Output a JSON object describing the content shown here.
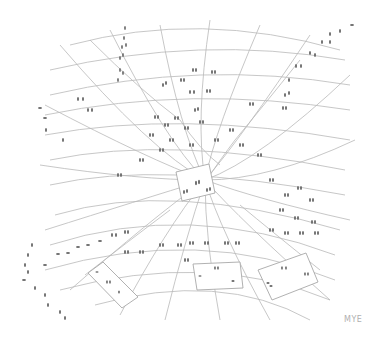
{
  "artwork": {
    "description": "Pencil drawing of a warped grid spiralling into a central tilted square, with footprint tracks and several tilted blank panels",
    "signature": "MYE",
    "colors": {
      "background": "#ffffff",
      "grid_line": "#b9b9b9",
      "footprint": "#6a6a6a",
      "signature": "#b0b0b0"
    },
    "center_square": {
      "label": "central-panel"
    },
    "panels": [
      {
        "name": "lower-left-panel"
      },
      {
        "name": "lower-center-panel"
      },
      {
        "name": "lower-right-panel"
      }
    ]
  }
}
